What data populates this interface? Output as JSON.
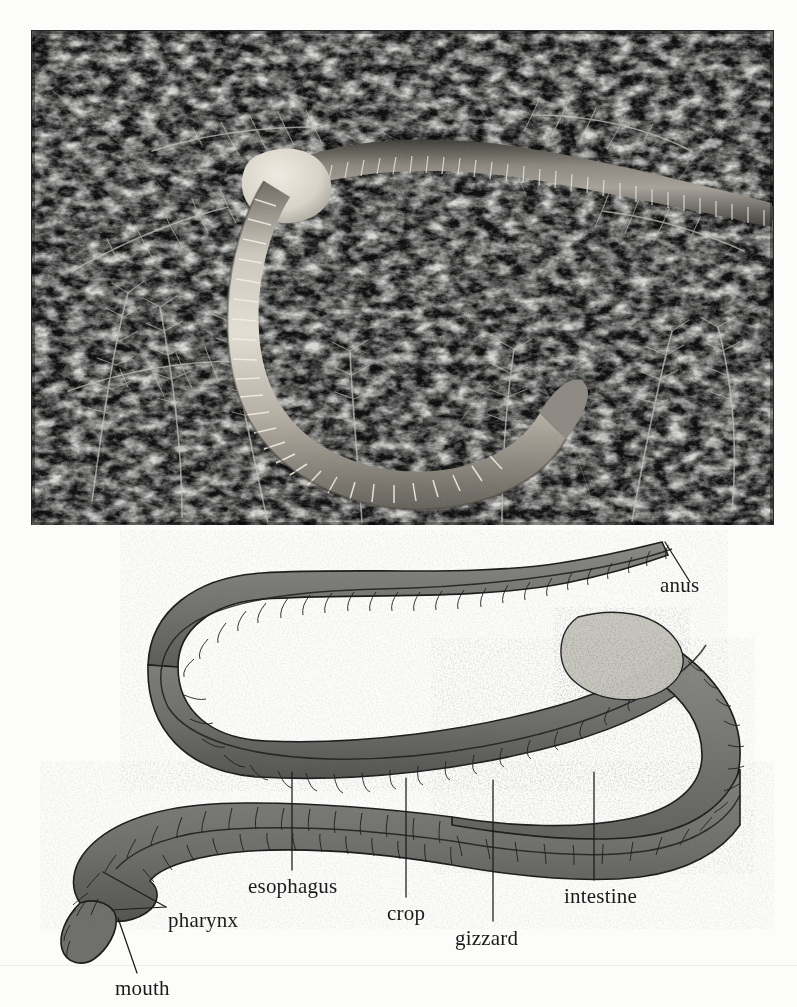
{
  "figure": {
    "kind": "two-panel biology figure"
  },
  "photo": {
    "name": "earthworm-photograph",
    "description": "black and white photograph of an earthworm crawling over mossy vegetation",
    "frame": {
      "x": 32,
      "y": 31,
      "width": 741,
      "height": 494
    },
    "colors": {
      "background": "#101010",
      "foliage_light": "#cfcfcf",
      "foliage_mid": "#6e6e6e",
      "worm_light": "#dedad2",
      "worm_mid": "#a8a399",
      "worm_dark": "#5d5a53"
    }
  },
  "diagram": {
    "name": "earthworm-digestive-diagram",
    "colors": {
      "body_fill": "#7c7c7c",
      "body_shade": "#5f5f5f",
      "body_light": "#b9b9b4",
      "outline": "#1c1c1c",
      "clitellum": "#c9c8c0"
    },
    "labels": [
      {
        "id": "anus",
        "text": "anus",
        "x": 660,
        "y": 592,
        "anchor": "start",
        "leader": [
          [
            703,
            570
          ],
          [
            678,
            578
          ]
        ]
      },
      {
        "id": "esophagus",
        "text": "esophagus",
        "x": 248,
        "y": 893,
        "anchor": "start",
        "leader": [
          [
            292,
            772
          ],
          [
            292,
            868
          ]
        ]
      },
      {
        "id": "crop",
        "text": "crop",
        "x": 387,
        "y": 920,
        "anchor": "start",
        "leader": [
          [
            406,
            778
          ],
          [
            406,
            896
          ]
        ]
      },
      {
        "id": "gizzard",
        "text": "gizzard",
        "x": 455,
        "y": 945,
        "anchor": "start",
        "leader": [
          [
            493,
            780
          ],
          [
            493,
            920
          ]
        ]
      },
      {
        "id": "intestine",
        "text": "intestine",
        "x": 564,
        "y": 903,
        "anchor": "start",
        "leader": [
          [
            594,
            772
          ],
          [
            594,
            880
          ]
        ]
      },
      {
        "id": "pharynx",
        "text": "pharynx",
        "x": 168,
        "y": 927,
        "anchor": "start",
        "leader": [
          [
            169,
            904
          ],
          [
            169,
            904
          ]
        ]
      },
      {
        "id": "mouth",
        "text": "mouth",
        "x": 115,
        "y": 995,
        "anchor": "start",
        "leader": [
          [
            118,
            918
          ],
          [
            135,
            972
          ]
        ]
      }
    ],
    "pharynx_forks": [
      [
        [
          164,
          908
        ],
        [
          103,
          872
        ]
      ],
      [
        [
          164,
          908
        ],
        [
          112,
          910
        ]
      ]
    ]
  }
}
